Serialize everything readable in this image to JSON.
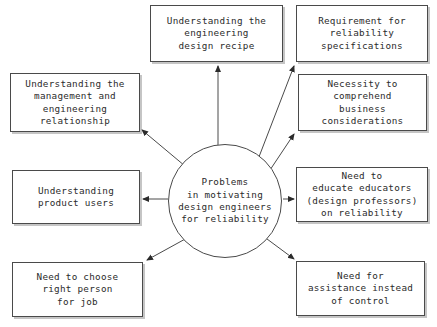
{
  "diagram": {
    "title": "Problems in motivating design engineers for reliability",
    "type": "hub-and-spoke",
    "background_color": "#ffffff",
    "line_color": "#4a4a4a",
    "text_color": "#2b2b2b",
    "hub": {
      "label": "Problems\nin motivating\ndesign engineers\nfor reliability",
      "cx": 225,
      "cy": 201,
      "r": 57
    },
    "nodes": [
      {
        "id": "engineering-design-recipe",
        "label": "Understanding the\nengineering\ndesign recipe",
        "x": 150,
        "y": 5,
        "w": 133,
        "h": 57,
        "position": "top"
      },
      {
        "id": "reliability-specifications",
        "label": "Requirement for\nreliability\nspecifications",
        "x": 296,
        "y": 5,
        "w": 132,
        "h": 57,
        "position": "top-right"
      },
      {
        "id": "business-considerations",
        "label": "Necessity to\ncomprehend\nbusiness\nconsiderations",
        "x": 298,
        "y": 74,
        "w": 129,
        "h": 57,
        "position": "upper-right"
      },
      {
        "id": "management-engineering-relationship",
        "label": "Understanding the\nmanagement and\nengineering\nrelationship",
        "x": 10,
        "y": 73,
        "w": 130,
        "h": 59,
        "position": "upper-left"
      },
      {
        "id": "product-users",
        "label": "Understanding\nproduct users",
        "x": 12,
        "y": 170,
        "w": 128,
        "h": 54,
        "position": "left"
      },
      {
        "id": "educate-educators",
        "label": "Need to\neducate educators\n(design professors)\non reliability",
        "x": 296,
        "y": 167,
        "w": 132,
        "h": 55,
        "position": "right"
      },
      {
        "id": "right-person-for-job",
        "label": "Need to choose\nright person\nfor job",
        "x": 12,
        "y": 262,
        "w": 131,
        "h": 55,
        "position": "bottom-left"
      },
      {
        "id": "assistance-instead-of-control",
        "label": "Need for\nassistance instead\nof control",
        "x": 296,
        "y": 261,
        "w": 129,
        "h": 55,
        "position": "bottom-right"
      }
    ],
    "connectors": [
      {
        "from": "hub",
        "to": "engineering-design-recipe",
        "x1": 218,
        "y1": 146,
        "x2": 218,
        "y2": 63,
        "arrow": "end"
      },
      {
        "from": "hub",
        "to": "reliability-specifications",
        "x1": 257,
        "y1": 162,
        "x2": 297,
        "y2": 63,
        "arrow": "end"
      },
      {
        "from": "hub",
        "to": "business-considerations",
        "x1": 266,
        "y1": 175,
        "x2": 297,
        "y2": 132,
        "arrow": "end"
      },
      {
        "from": "hub",
        "to": "management-engineering-relationship",
        "x1": 185,
        "y1": 166,
        "x2": 139,
        "y2": 128,
        "arrow": "end"
      },
      {
        "from": "hub",
        "to": "product-users",
        "x1": 168,
        "y1": 199,
        "x2": 139,
        "y2": 199,
        "arrow": "end"
      },
      {
        "from": "hub",
        "to": "educate-educators",
        "x1": 283,
        "y1": 199,
        "x2": 297,
        "y2": 199,
        "arrow": "end"
      },
      {
        "from": "hub",
        "to": "right-person-for-job",
        "x1": 187,
        "y1": 238,
        "x2": 144,
        "y2": 262,
        "arrow": "end"
      },
      {
        "from": "hub",
        "to": "assistance-instead-of-control",
        "x1": 263,
        "y1": 236,
        "x2": 297,
        "y2": 261,
        "arrow": "end"
      }
    ]
  }
}
